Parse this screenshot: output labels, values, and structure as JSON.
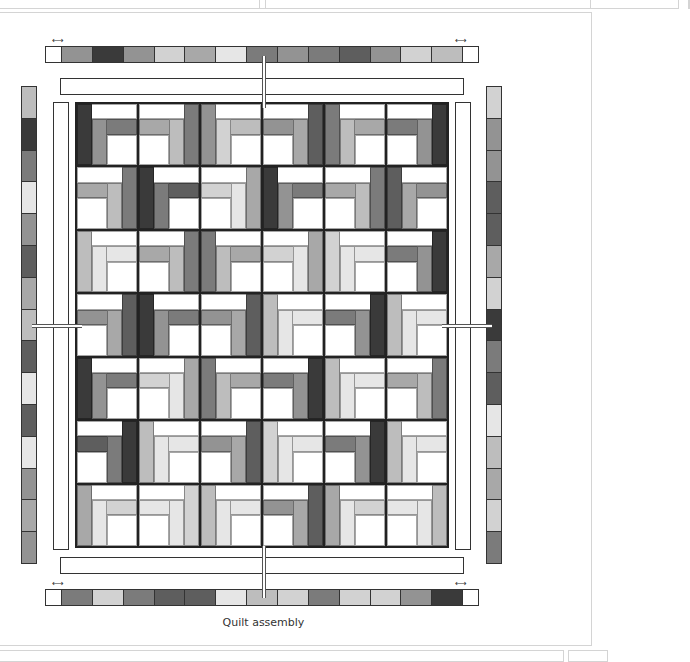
{
  "caption": "Quilt assembly",
  "colors": {
    "w": "#ffffff",
    "l1": "#e6e6e6",
    "l2": "#d2d2d2",
    "l3": "#bdbdbd",
    "m1": "#a8a8a8",
    "m2": "#939393",
    "d1": "#7b7b7b",
    "d2": "#5e5e5e",
    "d3": "#3a3a3a",
    "outline": "#333333"
  },
  "top_border": [
    "w",
    "m2",
    "d3",
    "m2",
    "l2",
    "m1",
    "l1",
    "d1",
    "m2",
    "d1",
    "d2",
    "m2",
    "l2",
    "l3",
    "w"
  ],
  "bottom_border": [
    "w",
    "d1",
    "l2",
    "d1",
    "d2",
    "d2",
    "l1",
    "l3",
    "l2",
    "d1",
    "l2",
    "l2",
    "m2",
    "d3",
    "w"
  ],
  "left_border": [
    "l3",
    "d3",
    "d1",
    "l1",
    "m2",
    "d2",
    "m1",
    "l3",
    "d2",
    "l1",
    "d2",
    "l1",
    "m2",
    "m1",
    "m2"
  ],
  "right_border": [
    "l2",
    "m2",
    "m2",
    "d2",
    "d2",
    "m1",
    "l2",
    "d3",
    "d1",
    "d2",
    "l1",
    "l3",
    "m1",
    "l2",
    "d1"
  ],
  "blocks": [
    [
      "d2",
      "m2",
      "m1",
      "d1",
      "m2",
      "d2"
    ],
    [
      "m2",
      "d3",
      "l3",
      "d2",
      "m2",
      "d1"
    ],
    [
      "l2",
      "m2",
      "m2",
      "l3",
      "l1",
      "d2"
    ],
    [
      "d1",
      "d2",
      "d1",
      "l2",
      "d2",
      "l2"
    ],
    [
      "d2",
      "l3",
      "m2",
      "d2",
      "l2",
      "m2"
    ],
    [
      "d3",
      "l2",
      "d1",
      "l1",
      "d2",
      "l2"
    ],
    [
      "l3",
      "l1",
      "l2",
      "d1",
      "l3",
      "l2"
    ]
  ],
  "block_orientation": [
    [
      "tl",
      "tr",
      "tl",
      "tr",
      "tl",
      "tr"
    ],
    [
      "tr",
      "tl",
      "tr",
      "tl",
      "tr",
      "tl"
    ],
    [
      "tl",
      "tr",
      "tl",
      "tr",
      "tl",
      "tr"
    ],
    [
      "tr",
      "tl",
      "tr",
      "tl",
      "tr",
      "tl"
    ],
    [
      "tl",
      "tr",
      "tl",
      "tr",
      "tl",
      "tr"
    ],
    [
      "tr",
      "tl",
      "tr",
      "tl",
      "tr",
      "tl"
    ],
    [
      "tl",
      "tr",
      "tl",
      "tr",
      "tl",
      "tr"
    ]
  ]
}
